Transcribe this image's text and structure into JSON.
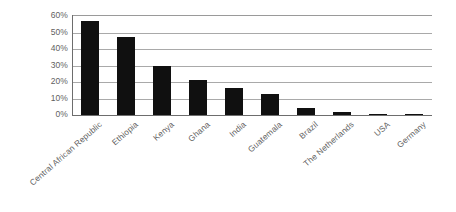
{
  "chart_data": {
    "type": "bar",
    "title": "",
    "subtitle": "",
    "xlabel": "",
    "ylabel": "",
    "ylim": [
      0,
      60
    ],
    "ytick_labels": [
      "0%",
      "10%",
      "20%",
      "30%",
      "40%",
      "50%",
      "60%"
    ],
    "ytick_values": [
      0,
      10,
      20,
      30,
      40,
      50,
      60
    ],
    "grid": true,
    "legend": false,
    "legend_position": "none",
    "bar_color": "#101010",
    "gridline_color": "#a9a9a9",
    "axis_color": "#6d6d6d",
    "label_color": "#5f5f5f",
    "categories": [
      "Central African Republic",
      "Ethiopia",
      "Kenya",
      "Ghana",
      "India",
      "Guatemala",
      "Brazil",
      "The Netherlands",
      "USA",
      "Germany"
    ],
    "values": [
      57,
      47,
      29.5,
      21,
      16.5,
      12.5,
      4.5,
      2,
      0.8,
      0.5
    ]
  }
}
